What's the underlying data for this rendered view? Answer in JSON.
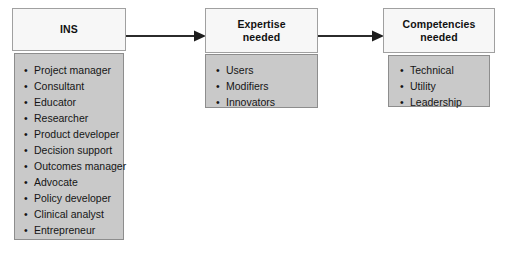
{
  "diagram": {
    "colors": {
      "header_fill": "#f7f7f7",
      "body_fill": "#c9c9c9",
      "border": "#9a9a9a",
      "text": "#111111",
      "arrow": "#2b2b2b",
      "background": "#ffffff"
    },
    "boxes": [
      {
        "id": "ins",
        "title": "INS",
        "items": [
          "Project manager",
          "Consultant",
          "Educator",
          "Researcher",
          "Product developer",
          "Decision support",
          "Outcomes manager",
          "Advocate",
          "Policy developer",
          "Clinical analyst",
          "Entrepreneur"
        ]
      },
      {
        "id": "expertise",
        "title": "Expertise needed",
        "title_line_1": "Expertise",
        "title_line_2": "needed",
        "items": [
          "Users",
          "Modifiers",
          "Innovators"
        ]
      },
      {
        "id": "competencies",
        "title": "Competencies needed",
        "title_line_1": "Competencies",
        "title_line_2": "needed",
        "items": [
          "Technical",
          "Utility",
          "Leadership"
        ]
      }
    ],
    "arrows": [
      {
        "id": "arrow-ins-to-expertise",
        "from": "ins",
        "to": "expertise"
      },
      {
        "id": "arrow-expertise-to-competencies",
        "from": "expertise",
        "to": "competencies"
      }
    ]
  }
}
